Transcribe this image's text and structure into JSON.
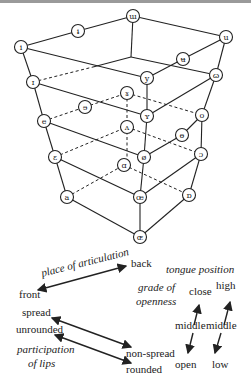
{
  "diagram": {
    "nodes": [
      {
        "id": "n1",
        "symbol": "ɯ",
        "x": 133,
        "y": 16
      },
      {
        "id": "n2",
        "symbol": "ɨ",
        "x": 78,
        "y": 31
      },
      {
        "id": "n3",
        "symbol": "i",
        "x": 21,
        "y": 47
      },
      {
        "id": "n4",
        "symbol": "u",
        "x": 226,
        "y": 37
      },
      {
        "id": "n5",
        "symbol": "ʉ",
        "x": 183,
        "y": 59
      },
      {
        "id": "n6",
        "symbol": "y",
        "x": 147,
        "y": 78
      },
      {
        "id": "n7",
        "symbol": "ɷ",
        "x": 216,
        "y": 75
      },
      {
        "id": "n8",
        "symbol": "ɪ",
        "x": 33,
        "y": 82
      },
      {
        "id": "n9",
        "symbol": "ɤ",
        "x": 127,
        "y": 93
      },
      {
        "id": "n10",
        "symbol": "ɘ",
        "x": 85,
        "y": 107
      },
      {
        "id": "n11",
        "symbol": "e",
        "x": 44,
        "y": 121
      },
      {
        "id": "n12",
        "symbol": "ʏ",
        "x": 147,
        "y": 116
      },
      {
        "id": "n13",
        "symbol": "o",
        "x": 202,
        "y": 115
      },
      {
        "id": "n14",
        "symbol": "ʌ",
        "x": 127,
        "y": 127
      },
      {
        "id": "n15",
        "symbol": "ɵ",
        "x": 182,
        "y": 135
      },
      {
        "id": "n16",
        "symbol": "ɛ",
        "x": 55,
        "y": 157
      },
      {
        "id": "n17",
        "symbol": "ø",
        "x": 144,
        "y": 157
      },
      {
        "id": "n18",
        "symbol": "ɔ",
        "x": 201,
        "y": 154
      },
      {
        "id": "n19",
        "symbol": "ɑ",
        "x": 124,
        "y": 165
      },
      {
        "id": "n20",
        "symbol": "a",
        "x": 67,
        "y": 197
      },
      {
        "id": "n21",
        "symbol": "œ",
        "x": 140,
        "y": 197
      },
      {
        "id": "n22",
        "symbol": "ɒ",
        "x": 189,
        "y": 195
      },
      {
        "id": "n23",
        "symbol": "ɶ",
        "x": 140,
        "y": 237
      }
    ]
  },
  "legend": {
    "place_of_articulation": "place of articulation",
    "front": "front",
    "back": "back",
    "tongue_position": "tongue position",
    "grade_of": "grade of",
    "openness": "openness",
    "close": "close",
    "high": "high",
    "middle_1": "middle",
    "middle_2": "middle",
    "open": "open",
    "low": "low",
    "spread": "spread",
    "unrounded": "unrounded",
    "participation": "participation",
    "of_lips": "of lips",
    "non_spread": "non-spread",
    "rounded": "rounded"
  }
}
